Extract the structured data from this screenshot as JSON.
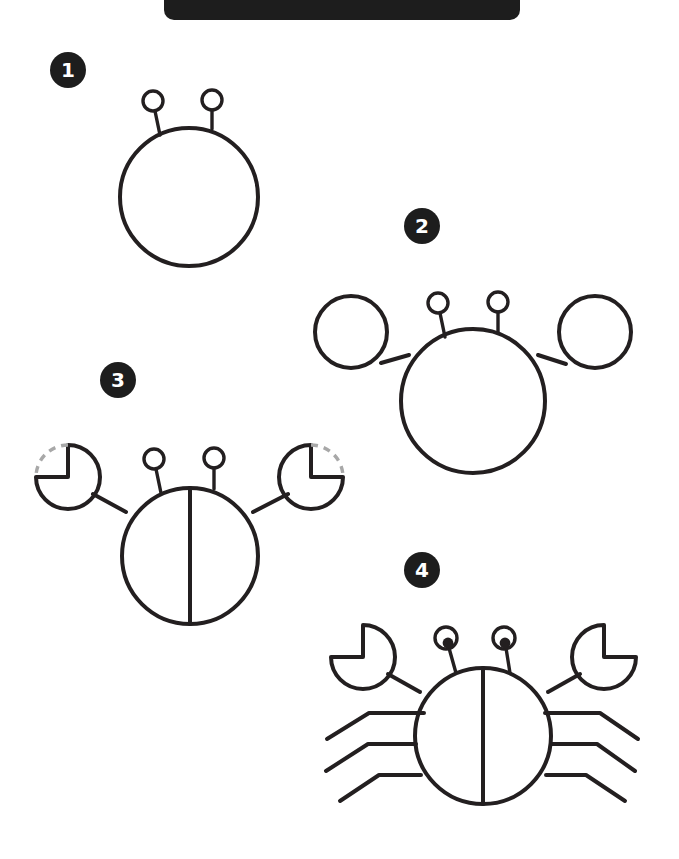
{
  "page": {
    "background_color": "#ffffff",
    "ink_color": "#231f20",
    "guide_color": "#a8a8a8",
    "badge_color": "#1d1d1d",
    "badge_text_color": "#ffffff",
    "width": 679,
    "height": 859
  },
  "banner": {
    "name": "title-banner",
    "label": "",
    "color": "#1d1d1d",
    "note": "solid dark rounded bar, cropped at top edge of page"
  },
  "steps": [
    {
      "number": "1",
      "badge_position": {
        "x": 68,
        "y": 70
      },
      "description": "Draw a large circle for the body and two small circles on short stalks for the eyes.",
      "parts": [
        "body-circle",
        "eye-stalk-left",
        "eye-stalk-right"
      ]
    },
    {
      "number": "2",
      "badge_position": {
        "x": 422,
        "y": 226
      },
      "description": "Add two medium circles for the claws, each joined to the body by a straight arm line.",
      "parts": [
        "body-circle",
        "eye-stalk-left",
        "eye-stalk-right",
        "claw-circle-left",
        "claw-circle-right",
        "arm-left",
        "arm-right"
      ]
    },
    {
      "number": "3",
      "badge_position": {
        "x": 118,
        "y": 380
      },
      "description": "Cut a pie wedge out of each claw circle to make pincers, and draw a vertical line down the middle of the body.",
      "parts": [
        "body-circle",
        "body-center-line",
        "eye-stalk-left",
        "eye-stalk-right",
        "pincer-left",
        "pincer-right",
        "arm-left",
        "arm-right"
      ],
      "guides": [
        "dashed-arc-left",
        "dashed-arc-right"
      ]
    },
    {
      "number": "4",
      "badge_position": {
        "x": 422,
        "y": 570
      },
      "description": "Finish the crab: fill in the eye pupils and add three bent legs on each side.",
      "parts": [
        "body-circle",
        "body-center-line",
        "eye-stalk-left",
        "eye-stalk-right",
        "eye-pupil-left",
        "eye-pupil-right",
        "pincer-left",
        "pincer-right",
        "arm-left",
        "arm-right",
        "legs-left",
        "legs-right"
      ]
    }
  ]
}
